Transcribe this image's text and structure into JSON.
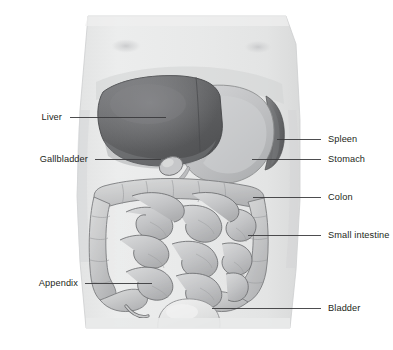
{
  "figure": {
    "title": "",
    "background_color": "#ffffff",
    "width": 393,
    "height": 350
  },
  "palette": {
    "body_fill_light": "#e9eaea",
    "body_fill_mid": "#dedfdf",
    "body_edge": "#c9cacb",
    "liver_dark": "#58595b",
    "liver_mid": "#6d6e70",
    "liver_light": "#808184",
    "stomach_light": "#c7c8ca",
    "stomach_mid": "#aeb0b2",
    "spleen_dark": "#6f7072",
    "colon_light": "#d4d5d6",
    "colon_mid": "#bcbdbf",
    "intestine_light": "#cfd0d1",
    "intestine_outline": "#6c6d6f",
    "bladder_light": "#e2e3e3",
    "leader_line": "#3a3a3c",
    "label_text": "#231f20"
  },
  "labels": {
    "left": [
      {
        "id": "liver",
        "text": "Liver",
        "text_x": 62,
        "text_y": 120,
        "line_x1": 70,
        "line_y1": 117,
        "line_x2": 166,
        "line_y2": 117
      },
      {
        "id": "gallbladder",
        "text": "Gallbladder",
        "text_x": 88,
        "text_y": 162,
        "line_x1": 95,
        "line_y1": 159,
        "line_x2": 161,
        "line_y2": 159
      },
      {
        "id": "appendix",
        "text": "Appendix",
        "text_x": 78,
        "text_y": 286,
        "line_x1": 85,
        "line_y1": 283,
        "line_x2": 152,
        "line_y2": 283
      }
    ],
    "right": [
      {
        "id": "spleen",
        "text": "Spleen",
        "text_x": 328,
        "text_y": 142,
        "line_x1": 277,
        "line_y1": 139,
        "line_x2": 321,
        "line_y2": 139
      },
      {
        "id": "stomach",
        "text": "Stomach",
        "text_x": 328,
        "text_y": 162,
        "line_x1": 252,
        "line_y1": 159,
        "line_x2": 321,
        "line_y2": 159
      },
      {
        "id": "colon",
        "text": "Colon",
        "text_x": 328,
        "text_y": 200,
        "line_x1": 253,
        "line_y1": 197,
        "line_x2": 321,
        "line_y2": 197
      },
      {
        "id": "small-intestine",
        "text": "Small intestine",
        "text_x": 328,
        "text_y": 238,
        "line_x1": 248,
        "line_y1": 235,
        "line_x2": 321,
        "line_y2": 235
      },
      {
        "id": "bladder",
        "text": "Bladder",
        "text_x": 328,
        "text_y": 311,
        "line_x1": 212,
        "line_y1": 308,
        "line_x2": 321,
        "line_y2": 308
      }
    ]
  },
  "organs": [
    {
      "id": "liver",
      "name": "Liver"
    },
    {
      "id": "gallbladder",
      "name": "Gallbladder"
    },
    {
      "id": "stomach",
      "name": "Stomach"
    },
    {
      "id": "spleen",
      "name": "Spleen"
    },
    {
      "id": "colon",
      "name": "Colon"
    },
    {
      "id": "small-intestine",
      "name": "Small intestine"
    },
    {
      "id": "appendix",
      "name": "Appendix"
    },
    {
      "id": "bladder",
      "name": "Bladder"
    }
  ]
}
